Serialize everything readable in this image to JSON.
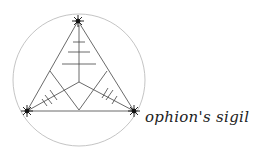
{
  "logo": {
    "wordmark": "ophion's sigil",
    "stroke_color": "#333333",
    "circle_color": "#b0b0b0",
    "symbol": "triangle-in-circle-sigil"
  }
}
